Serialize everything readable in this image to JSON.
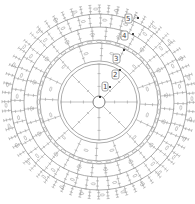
{
  "diagram": {
    "rounds": [
      {
        "number": "1",
        "stitches": 8
      },
      {
        "number": "2",
        "stitches": 16
      },
      {
        "number": "3",
        "stitches": 32
      },
      {
        "number": "4",
        "stitches": 48
      },
      {
        "number": "5",
        "stitches": 64
      }
    ],
    "start": "magic-ring",
    "colors": {
      "line": "#9a9a9a",
      "marker": "#111111",
      "label": "#444444"
    }
  }
}
